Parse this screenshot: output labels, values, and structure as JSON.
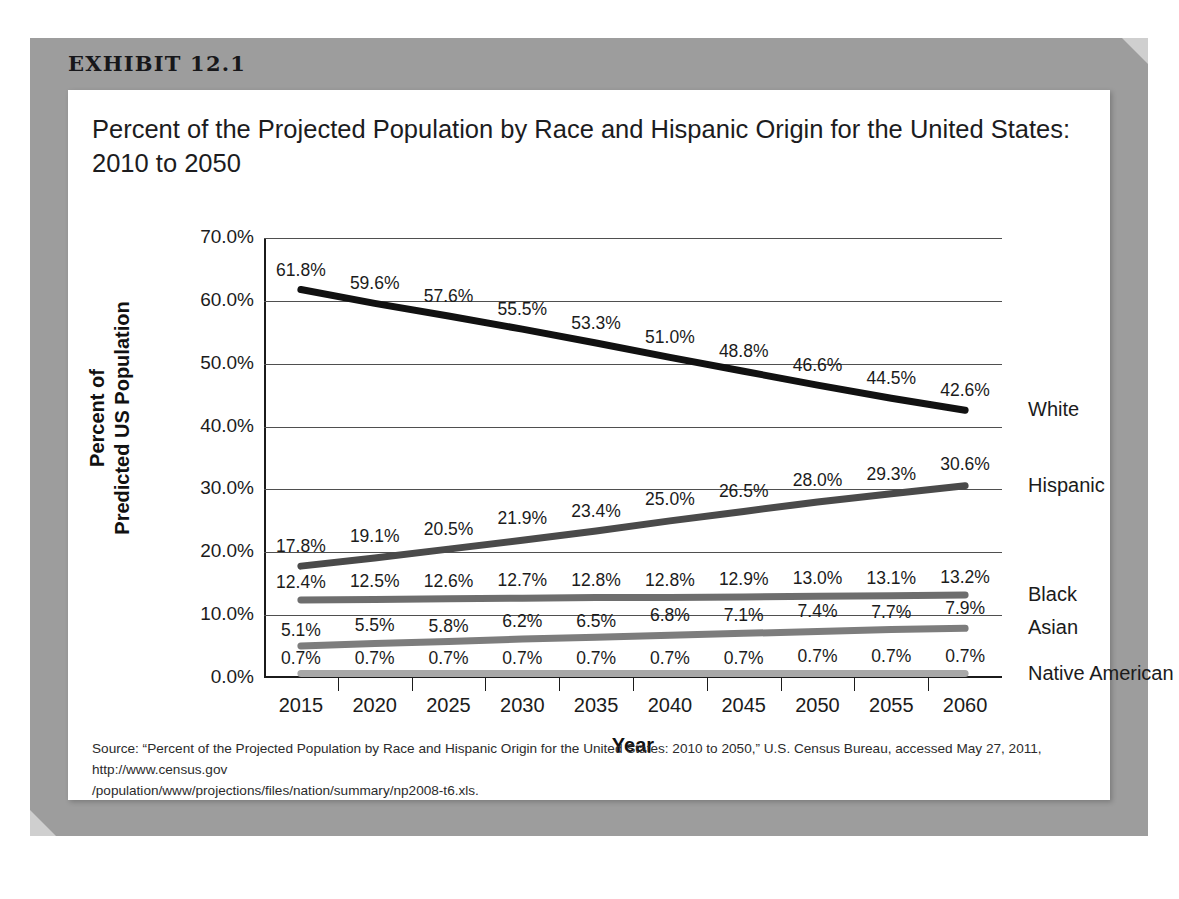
{
  "exhibit": {
    "number": "EXHIBIT 12.1",
    "title": "Percent of the Projected Population by Race and Hispanic Origin for the United States: 2010 to 2050",
    "source_line1": "Source: “Percent of the Projected Population by Race and Hispanic Origin for the United States:  2010 to 2050,” U.S. Census Bureau, accessed May 27, 2011, http://www.census.gov",
    "source_line2": "/population/www/projections/files/nation/summary/np2008-t6.xls."
  },
  "axis_titles": {
    "y_line1": "Percent of",
    "y_line2": "Predicted US Population",
    "x": "Year"
  },
  "chart_data": {
    "type": "line",
    "title": "Percent of the Projected Population by Race and Hispanic Origin for the United States: 2010 to 2050",
    "xlabel": "Year",
    "ylabel": "Percent of Predicted US Population",
    "x": [
      2015,
      2020,
      2025,
      2030,
      2035,
      2040,
      2045,
      2050,
      2055,
      2060
    ],
    "xtick_labels": [
      "2015",
      "2020",
      "2025",
      "2030",
      "2035",
      "2040",
      "2045",
      "2050",
      "2055",
      "2060"
    ],
    "ylim": [
      0,
      70
    ],
    "ytick_labels": [
      "0.0%",
      "10.0%",
      "20.0%",
      "30.0%",
      "40.0%",
      "50.0%",
      "60.0%",
      "70.0%"
    ],
    "ytick_values": [
      0,
      10,
      20,
      30,
      40,
      50,
      60,
      70
    ],
    "grid": true,
    "legend_position": "right-of-plot-end-labels",
    "series": [
      {
        "name": "White",
        "color": "#111111",
        "width": 7,
        "values": [
          61.8,
          59.6,
          57.6,
          55.5,
          53.3,
          51.0,
          48.8,
          46.6,
          44.5,
          42.6
        ],
        "labels": [
          "61.8%",
          "59.6%",
          "57.6%",
          "55.5%",
          "53.3%",
          "51.0%",
          "48.8%",
          "46.6%",
          "44.5%",
          "42.6%"
        ]
      },
      {
        "name": "Hispanic",
        "color": "#4a4a4a",
        "width": 7,
        "values": [
          17.8,
          19.1,
          20.5,
          21.9,
          23.4,
          25.0,
          26.5,
          28.0,
          29.3,
          30.6
        ],
        "labels": [
          "17.8%",
          "19.1%",
          "20.5%",
          "21.9%",
          "23.4%",
          "25.0%",
          "26.5%",
          "28.0%",
          "29.3%",
          "30.6%"
        ]
      },
      {
        "name": "Black",
        "color": "#6e6e6e",
        "width": 7,
        "values": [
          12.4,
          12.5,
          12.6,
          12.7,
          12.8,
          12.8,
          12.9,
          13.0,
          13.1,
          13.2
        ],
        "labels": [
          "12.4%",
          "12.5%",
          "12.6%",
          "12.7%",
          "12.8%",
          "12.8%",
          "12.9%",
          "13.0%",
          "13.1%",
          "13.2%"
        ]
      },
      {
        "name": "Asian",
        "color": "#7d7d7d",
        "width": 7,
        "values": [
          5.1,
          5.5,
          5.8,
          6.2,
          6.5,
          6.8,
          7.1,
          7.4,
          7.7,
          7.9
        ],
        "labels": [
          "5.1%",
          "5.5%",
          "5.8%",
          "6.2%",
          "6.5%",
          "6.8%",
          "7.1%",
          "7.4%",
          "7.7%",
          "7.9%"
        ]
      },
      {
        "name": "Native American",
        "color": "#a8a8a8",
        "width": 7,
        "values": [
          0.7,
          0.7,
          0.7,
          0.7,
          0.7,
          0.7,
          0.7,
          0.7,
          0.7,
          0.7
        ],
        "labels": [
          "0.7%",
          "0.7%",
          "0.7%",
          "0.7%",
          "0.7%",
          "0.7%",
          "0.7%",
          "0.7%",
          "0.7%",
          "0.7%"
        ]
      }
    ]
  }
}
